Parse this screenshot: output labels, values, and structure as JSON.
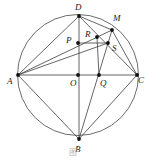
{
  "figure": {
    "caption": "图",
    "stroke_color": "#3d3d3d",
    "circle_color": "#5a5a5a",
    "point_color": "#111111",
    "label_color": "#1a1a1a",
    "background": "#ffffff",
    "circle": {
      "cx": 78,
      "cy": 75,
      "r": 60.5
    },
    "points": [
      {
        "id": "A",
        "label": "A",
        "x": 18,
        "y": 75,
        "lx": 7,
        "ly": 77
      },
      {
        "id": "B",
        "label": "B",
        "x": 79,
        "y": 139,
        "lx": 75,
        "ly": 145
      },
      {
        "id": "C",
        "label": "C",
        "x": 137,
        "y": 75,
        "lx": 138,
        "ly": 76
      },
      {
        "id": "D",
        "label": "D",
        "x": 79,
        "y": 16,
        "lx": 75,
        "ly": 3
      },
      {
        "id": "M",
        "label": "M",
        "x": 112,
        "y": 30,
        "lx": 113,
        "ly": 14
      },
      {
        "id": "O",
        "label": "O",
        "x": 78,
        "y": 75,
        "lx": 70,
        "ly": 79
      },
      {
        "id": "P",
        "label": "P",
        "x": 78,
        "y": 43,
        "lx": 66,
        "ly": 36
      },
      {
        "id": "Q",
        "label": "Q",
        "x": 99,
        "y": 75,
        "lx": 100,
        "ly": 79
      },
      {
        "id": "R",
        "label": "R",
        "x": 97,
        "y": 37,
        "lx": 85,
        "ly": 30
      },
      {
        "id": "S",
        "label": "S",
        "x": 108,
        "y": 43,
        "lx": 112,
        "ly": 44
      }
    ],
    "segments": [
      {
        "name": "segment-A-C",
        "x1": 18,
        "y1": 75,
        "x2": 137,
        "y2": 75
      },
      {
        "name": "segment-D-B",
        "x1": 79,
        "y1": 16,
        "x2": 79,
        "y2": 139
      },
      {
        "name": "segment-A-D",
        "x1": 18,
        "y1": 75,
        "x2": 79,
        "y2": 16
      },
      {
        "name": "segment-A-B",
        "x1": 18,
        "y1": 75,
        "x2": 79,
        "y2": 139
      },
      {
        "name": "segment-A-S",
        "x1": 18,
        "y1": 75,
        "x2": 108,
        "y2": 43
      },
      {
        "name": "segment-A-M",
        "x1": 18,
        "y1": 75,
        "x2": 112,
        "y2": 30
      },
      {
        "name": "segment-D-M",
        "x1": 79,
        "y1": 16,
        "x2": 112,
        "y2": 30
      },
      {
        "name": "segment-D-C",
        "x1": 79,
        "y1": 16,
        "x2": 137,
        "y2": 75
      },
      {
        "name": "segment-B-M",
        "x1": 79,
        "y1": 139,
        "x2": 112,
        "y2": 30
      },
      {
        "name": "segment-B-C",
        "x1": 79,
        "y1": 139,
        "x2": 137,
        "y2": 75
      },
      {
        "name": "segment-M-C",
        "x1": 112,
        "y1": 30,
        "x2": 137,
        "y2": 75
      },
      {
        "name": "segment-P-S",
        "x1": 78,
        "y1": 43,
        "x2": 108,
        "y2": 43
      },
      {
        "name": "segment-R-Q",
        "x1": 97,
        "y1": 37,
        "x2": 99,
        "y2": 75
      }
    ]
  }
}
